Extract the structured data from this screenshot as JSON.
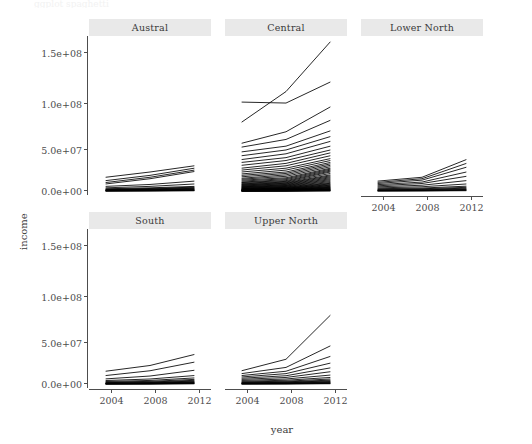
{
  "figure": {
    "kind": "ggplot2-facet-wrap-line-chart",
    "top_clipped_text": "ggplot spaghetti",
    "background": "#ffffff",
    "strip_fill": "#e9e9e9",
    "line_color": "#000000",
    "text_color": "#4d4d4d"
  },
  "axes": {
    "xlabel": "year",
    "ylabel": "income",
    "x_ticks": [
      "2004",
      "2008",
      "2012"
    ],
    "x_tick_values": [
      2004,
      2008,
      2012
    ],
    "y_ticks": [
      "0.0e+00",
      "5.0e+07",
      "1.0e+08",
      "1.5e+08"
    ],
    "y_tick_values": [
      0,
      50000000,
      100000000,
      150000000
    ],
    "xlim": [
      2002.5,
      2013.5
    ],
    "ylim": [
      -4000000,
      162000000
    ],
    "grid": "off"
  },
  "panels": [
    {
      "name": "austral",
      "label": "Austral",
      "row": 0,
      "col": 0,
      "x_axis_shown": false
    },
    {
      "name": "central",
      "label": "Central",
      "row": 0,
      "col": 1,
      "x_axis_shown": false
    },
    {
      "name": "lower-north",
      "label": "Lower North",
      "row": 0,
      "col": 2,
      "x_axis_shown": true
    },
    {
      "name": "south",
      "label": "South",
      "row": 1,
      "col": 0,
      "x_axis_shown": true
    },
    {
      "name": "upper-north",
      "label": "Upper North",
      "row": 1,
      "col": 1,
      "x_axis_shown": true
    }
  ],
  "chart_data": {
    "type": "line",
    "title": "",
    "xlabel": "year",
    "ylabel": "income",
    "facet_variable": "region",
    "facets": [
      "Austral",
      "Central",
      "Lower North",
      "South",
      "Upper North"
    ],
    "x": [
      2004,
      2008,
      2012
    ],
    "xlim": [
      2002.5,
      2013.5
    ],
    "ylim": [
      -4000000,
      162000000
    ],
    "y_tick_values": [
      0,
      50000000,
      100000000,
      150000000
    ],
    "y_tick_labels": [
      "0.0e+00",
      "5.0e+07",
      "1.0e+08",
      "1.5e+08"
    ],
    "x_tick_values": [
      2004,
      2008,
      2012
    ],
    "x_tick_labels": [
      "2004",
      "2008",
      "2012"
    ],
    "grid": "off",
    "legend": "none",
    "panel_series": {
      "Austral": [
        {
          "name": "A01",
          "values": [
            14500000,
            20000000,
            26500000
          ]
        },
        {
          "name": "A02",
          "values": [
            11000000,
            16500000,
            24000000
          ]
        },
        {
          "name": "A03",
          "values": [
            9000000,
            14500000,
            22000000
          ]
        },
        {
          "name": "A04",
          "values": [
            7500000,
            13000000,
            20500000
          ]
        },
        {
          "name": "A05",
          "values": [
            5000000,
            7000000,
            10500000
          ]
        },
        {
          "name": "A06",
          "values": [
            3500000,
            5000000,
            7500000
          ]
        },
        {
          "name": "A07",
          "values": [
            2500000,
            3500000,
            5000000
          ]
        },
        {
          "name": "A08",
          "values": [
            2000000,
            2800000,
            4200000
          ]
        },
        {
          "name": "A09",
          "values": [
            1600000,
            2300000,
            3600000
          ]
        },
        {
          "name": "A10",
          "values": [
            1300000,
            1900000,
            3000000
          ]
        },
        {
          "name": "A11",
          "values": [
            1000000,
            1500000,
            2500000
          ]
        },
        {
          "name": "A12",
          "values": [
            800000,
            1200000,
            2000000
          ]
        },
        {
          "name": "A13",
          "values": [
            600000,
            900000,
            1600000
          ]
        },
        {
          "name": "A14",
          "values": [
            450000,
            700000,
            1200000
          ]
        },
        {
          "name": "A15",
          "values": [
            300000,
            500000,
            900000
          ]
        },
        {
          "name": "A16",
          "values": [
            200000,
            350000,
            650000
          ]
        },
        {
          "name": "A17",
          "values": [
            120000,
            220000,
            450000
          ]
        }
      ],
      "Central": [
        {
          "name": "C01",
          "values": [
            72000000,
            104000000,
            156000000
          ]
        },
        {
          "name": "C02",
          "values": [
            93000000,
            92000000,
            114000000
          ]
        },
        {
          "name": "C03",
          "values": [
            50000000,
            62000000,
            88000000
          ]
        },
        {
          "name": "C04",
          "values": [
            46000000,
            54000000,
            74000000
          ]
        },
        {
          "name": "C05",
          "values": [
            41000000,
            47000000,
            63000000
          ]
        },
        {
          "name": "C06",
          "values": [
            37000000,
            43000000,
            57000000
          ]
        },
        {
          "name": "C07",
          "values": [
            33000000,
            39000000,
            52000000
          ]
        },
        {
          "name": "C08",
          "values": [
            30000000,
            35000000,
            47000000
          ]
        },
        {
          "name": "C09",
          "values": [
            27000000,
            32000000,
            43000000
          ]
        },
        {
          "name": "C10",
          "values": [
            24000000,
            29000000,
            40000000
          ]
        },
        {
          "name": "C11",
          "values": [
            22000000,
            26500000,
            37000000
          ]
        },
        {
          "name": "C12",
          "values": [
            20000000,
            24000000,
            34000000
          ]
        },
        {
          "name": "C13",
          "values": [
            18000000,
            22000000,
            32000000
          ]
        },
        {
          "name": "C14",
          "values": [
            16500000,
            20000000,
            30000000
          ]
        },
        {
          "name": "C15",
          "values": [
            15000000,
            18500000,
            28500000
          ]
        },
        {
          "name": "C16",
          "values": [
            13500000,
            17000000,
            27000000
          ]
        },
        {
          "name": "C17",
          "values": [
            12500000,
            15500000,
            25500000
          ]
        },
        {
          "name": "C18",
          "values": [
            11500000,
            14000000,
            24000000
          ]
        },
        {
          "name": "C19",
          "values": [
            10500000,
            13000000,
            23000000
          ]
        },
        {
          "name": "C20",
          "values": [
            9500000,
            12000000,
            22000000
          ]
        },
        {
          "name": "C21",
          "values": [
            9000000,
            11000000,
            21000000
          ]
        },
        {
          "name": "C22",
          "values": [
            8200000,
            10200000,
            20000000
          ]
        },
        {
          "name": "C23",
          "values": [
            7600000,
            9500000,
            18500000
          ]
        },
        {
          "name": "C24",
          "values": [
            7000000,
            8800000,
            17000000
          ]
        },
        {
          "name": "C25",
          "values": [
            6500000,
            8200000,
            16000000
          ]
        },
        {
          "name": "C26",
          "values": [
            6000000,
            7600000,
            15000000
          ]
        },
        {
          "name": "C27",
          "values": [
            5500000,
            7000000,
            14000000
          ]
        },
        {
          "name": "C28",
          "values": [
            5000000,
            6400000,
            13000000
          ]
        },
        {
          "name": "C29",
          "values": [
            4600000,
            5900000,
            12000000
          ]
        },
        {
          "name": "C30",
          "values": [
            4200000,
            5400000,
            11000000
          ]
        },
        {
          "name": "C31",
          "values": [
            3800000,
            4900000,
            10000000
          ]
        },
        {
          "name": "C32",
          "values": [
            3400000,
            4400000,
            9000000
          ]
        },
        {
          "name": "C33",
          "values": [
            3000000,
            4000000,
            8200000
          ]
        },
        {
          "name": "C34",
          "values": [
            2700000,
            3600000,
            7500000
          ]
        },
        {
          "name": "C35",
          "values": [
            2400000,
            3200000,
            6800000
          ]
        },
        {
          "name": "C36",
          "values": [
            2100000,
            2900000,
            6200000
          ]
        },
        {
          "name": "C37",
          "values": [
            1900000,
            2600000,
            5600000
          ]
        },
        {
          "name": "C38",
          "values": [
            1700000,
            2300000,
            5000000
          ]
        },
        {
          "name": "C39",
          "values": [
            1500000,
            2000000,
            4500000
          ]
        },
        {
          "name": "C40",
          "values": [
            1300000,
            1800000,
            4000000
          ]
        },
        {
          "name": "C41",
          "values": [
            1100000,
            1600000,
            3600000
          ]
        },
        {
          "name": "C42",
          "values": [
            950000,
            1400000,
            3200000
          ]
        },
        {
          "name": "C43",
          "values": [
            800000,
            1200000,
            2800000
          ]
        },
        {
          "name": "C44",
          "values": [
            680000,
            1000000,
            2400000
          ]
        },
        {
          "name": "C45",
          "values": [
            560000,
            850000,
            2000000
          ]
        },
        {
          "name": "C46",
          "values": [
            450000,
            700000,
            1700000
          ]
        },
        {
          "name": "C47",
          "values": [
            360000,
            560000,
            1400000
          ]
        },
        {
          "name": "C48",
          "values": [
            280000,
            440000,
            1100000
          ]
        },
        {
          "name": "C49",
          "values": [
            200000,
            330000,
            850000
          ]
        },
        {
          "name": "C50",
          "values": [
            140000,
            240000,
            620000
          ]
        },
        {
          "name": "C51",
          "values": [
            90000,
            160000,
            420000
          ]
        },
        {
          "name": "C52",
          "values": [
            50000,
            95000,
            260000
          ]
        }
      ],
      "Lower North": [
        {
          "name": "L01",
          "values": [
            10500000,
            14500000,
            33000000
          ]
        },
        {
          "name": "L02",
          "values": [
            9200000,
            13000000,
            29000000
          ]
        },
        {
          "name": "L03",
          "values": [
            8000000,
            11500000,
            25000000
          ]
        },
        {
          "name": "L04",
          "values": [
            6800000,
            9500000,
            20000000
          ]
        },
        {
          "name": "L05",
          "values": [
            5600000,
            8000000,
            15500000
          ]
        },
        {
          "name": "L06",
          "values": [
            4500000,
            6200000,
            11000000
          ]
        },
        {
          "name": "L07",
          "values": [
            3400000,
            4600000,
            7500000
          ]
        },
        {
          "name": "L08",
          "values": [
            2500000,
            3300000,
            5200000
          ]
        },
        {
          "name": "L09",
          "values": [
            1900000,
            2500000,
            4000000
          ]
        },
        {
          "name": "L10",
          "values": [
            1400000,
            1900000,
            3100000
          ]
        },
        {
          "name": "L11",
          "values": [
            1000000,
            1400000,
            2400000
          ]
        },
        {
          "name": "L12",
          "values": [
            700000,
            1000000,
            1800000
          ]
        },
        {
          "name": "L13",
          "values": [
            450000,
            700000,
            1300000
          ]
        },
        {
          "name": "L14",
          "values": [
            260000,
            420000,
            850000
          ]
        },
        {
          "name": "L15",
          "values": [
            140000,
            230000,
            500000
          ]
        }
      ],
      "South": [
        {
          "name": "S01",
          "values": [
            13500000,
            19500000,
            31000000
          ]
        },
        {
          "name": "S02",
          "values": [
            9000000,
            14000000,
            23000000
          ]
        },
        {
          "name": "S03",
          "values": [
            5500000,
            8500000,
            14500000
          ]
        },
        {
          "name": "S04",
          "values": [
            3800000,
            5400000,
            9000000
          ]
        },
        {
          "name": "S05",
          "values": [
            2800000,
            3900000,
            6500000
          ]
        },
        {
          "name": "S06",
          "values": [
            2100000,
            2900000,
            5000000
          ]
        },
        {
          "name": "S07",
          "values": [
            1600000,
            2200000,
            4000000
          ]
        },
        {
          "name": "S08",
          "values": [
            1200000,
            1700000,
            3200000
          ]
        },
        {
          "name": "S09",
          "values": [
            900000,
            1300000,
            2600000
          ]
        },
        {
          "name": "S10",
          "values": [
            700000,
            1000000,
            2100000
          ]
        },
        {
          "name": "S11",
          "values": [
            520000,
            780000,
            1700000
          ]
        },
        {
          "name": "S12",
          "values": [
            380000,
            580000,
            1300000
          ]
        },
        {
          "name": "S13",
          "values": [
            260000,
            410000,
            950000
          ]
        },
        {
          "name": "S14",
          "values": [
            170000,
            270000,
            650000
          ]
        },
        {
          "name": "S15",
          "values": [
            95000,
            160000,
            400000
          ]
        }
      ],
      "Upper North": [
        {
          "name": "U01",
          "values": [
            14000000,
            26000000,
            72000000
          ]
        },
        {
          "name": "U02",
          "values": [
            11000000,
            17500000,
            40000000
          ]
        },
        {
          "name": "U03",
          "values": [
            9000000,
            13500000,
            29000000
          ]
        },
        {
          "name": "U04",
          "values": [
            7500000,
            11000000,
            22000000
          ]
        },
        {
          "name": "U05",
          "values": [
            6200000,
            8800000,
            17000000
          ]
        },
        {
          "name": "U06",
          "values": [
            5000000,
            7000000,
            13000000
          ]
        },
        {
          "name": "U07",
          "values": [
            3900000,
            5400000,
            9500000
          ]
        },
        {
          "name": "U08",
          "values": [
            3000000,
            4100000,
            7000000
          ]
        },
        {
          "name": "U09",
          "values": [
            2300000,
            3100000,
            5400000
          ]
        },
        {
          "name": "U10",
          "values": [
            1800000,
            2400000,
            4200000
          ]
        },
        {
          "name": "U11",
          "values": [
            1400000,
            1900000,
            3400000
          ]
        },
        {
          "name": "U12",
          "values": [
            1050000,
            1450000,
            2700000
          ]
        },
        {
          "name": "U13",
          "values": [
            780000,
            1100000,
            2100000
          ]
        },
        {
          "name": "U14",
          "values": [
            550000,
            800000,
            1600000
          ]
        },
        {
          "name": "U15",
          "values": [
            370000,
            550000,
            1150000
          ]
        },
        {
          "name": "U16",
          "values": [
            230000,
            350000,
            780000
          ]
        },
        {
          "name": "U17",
          "values": [
            120000,
            195000,
            450000
          ]
        }
      ]
    }
  }
}
